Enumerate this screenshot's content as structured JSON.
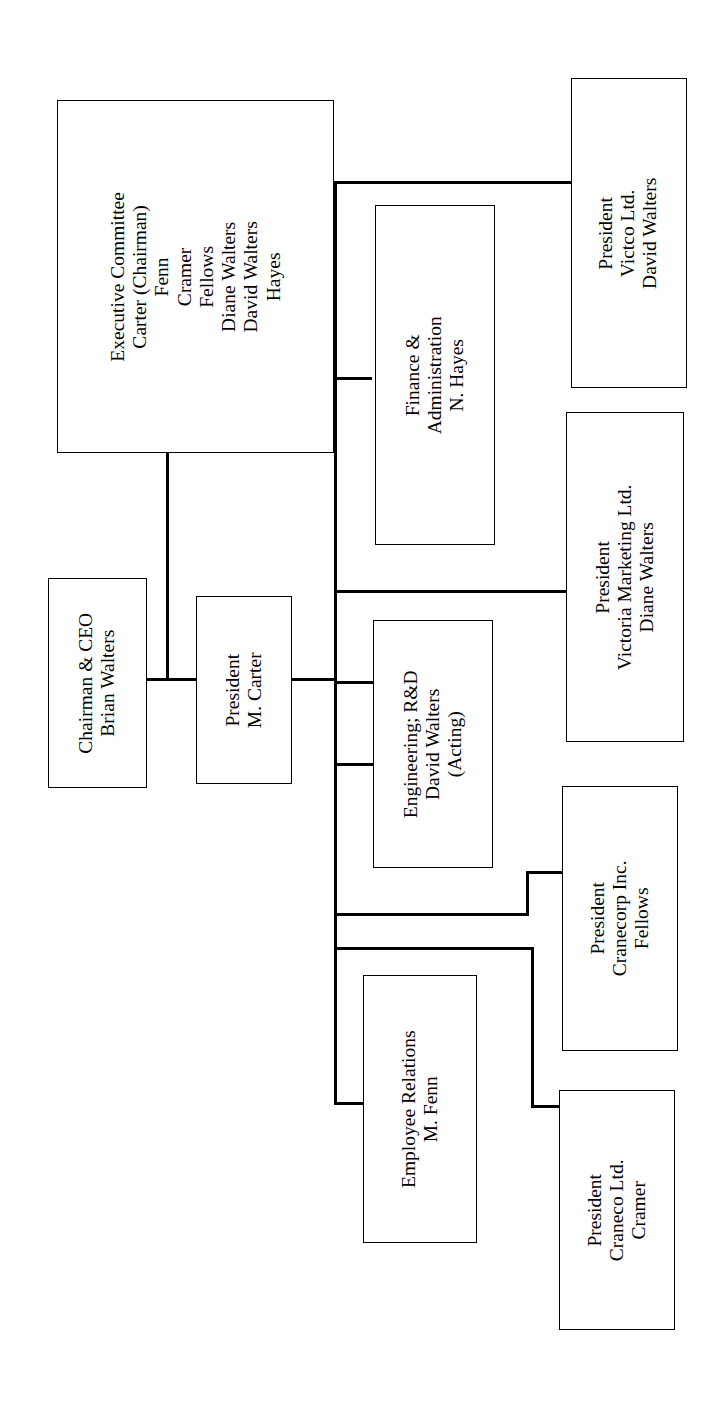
{
  "document": {
    "type": "organization-chart",
    "orientation": "rotated-90-counterclockwise",
    "ink_color": "#000000",
    "page_color": "#ffffff"
  },
  "nodes": {
    "executive_committee": {
      "title": "Executive Committee",
      "members": [
        "Carter (Chairman)",
        "Fenn",
        "Cramer",
        "Fellows",
        "Diane Walters",
        "David Walters",
        "Hayes"
      ]
    },
    "chairman_ceo": {
      "line1": "Chairman & CEO",
      "line2": "Brian Walters"
    },
    "president_carter": {
      "line1": "President",
      "line2": "M. Carter"
    },
    "finance_admin": {
      "line1": "Finance &",
      "line2": "Administration",
      "line3": "N. Hayes"
    },
    "engineering_rd": {
      "line1": "Engineering; R&D",
      "line2": "David Walters",
      "line3": "(Acting)"
    },
    "employee_relations": {
      "line1": "Employee Relations",
      "line2": "M. Fenn"
    },
    "victco": {
      "line1": "President",
      "line2": "Victco Ltd.",
      "line3": "David Walters"
    },
    "victoria_marketing": {
      "line1": "President",
      "line2": "Victoria Marketing Ltd.",
      "line3": "Diane Walters"
    },
    "cranecorp": {
      "line1": "President",
      "line2": "Cranecorp Inc.",
      "line3": "Fellows"
    },
    "craneco": {
      "line1": "President",
      "line2": "Craneco Ltd.",
      "line3": "Cramer"
    }
  }
}
